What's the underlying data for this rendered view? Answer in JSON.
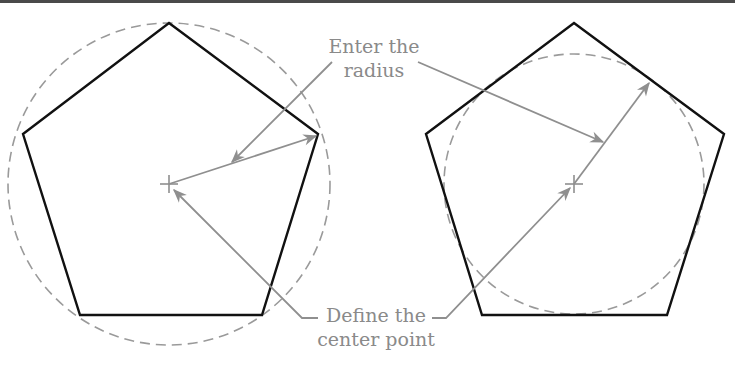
{
  "figure": {
    "labels": {
      "radius_line1": "Enter the",
      "radius_line2": "radius",
      "center_line1": "Define the",
      "center_line2": "center point"
    },
    "colors": {
      "polygon": "#111111",
      "construction": "#8f8f8f",
      "circle": "#9a9a9a",
      "text": "#8a8a8a"
    },
    "left_panel": {
      "polygon": "pentagon",
      "circle_mode": "inscribed-in-circle",
      "center": [
        169,
        184
      ],
      "radius": 161
    },
    "right_panel": {
      "polygon": "pentagon",
      "circle_mode": "circumscribed-about-circle",
      "center": [
        574,
        184
      ],
      "radius": 130
    }
  }
}
